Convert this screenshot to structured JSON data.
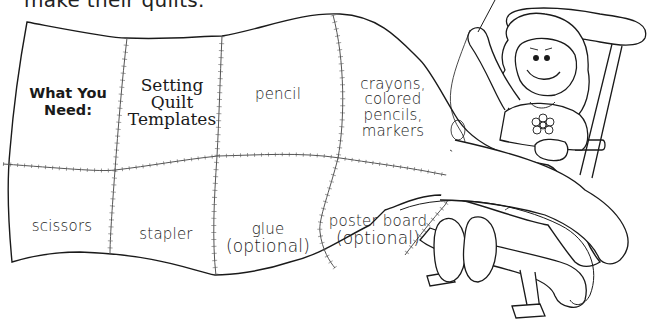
{
  "intro_text": "make their quilts.",
  "quilt": {
    "heading_line1": "What You",
    "heading_line2": "Need:",
    "top_row": [
      {
        "lines": [
          "Setting",
          "Quilt",
          "Templates"
        ]
      },
      {
        "lines": [
          "pencil"
        ]
      },
      {
        "lines": [
          "crayons,",
          "colored",
          "pencils,",
          "markers"
        ]
      }
    ],
    "bottom_row": [
      {
        "lines": [
          "scissors"
        ]
      },
      {
        "lines": [
          "stapler"
        ]
      },
      {
        "lines": [
          "glue",
          "(optional)"
        ]
      },
      {
        "lines": [
          "poster board",
          "(optional)"
        ]
      }
    ]
  },
  "illustration": {
    "subject": "girl-sewing-quilt-in-rocking-chair-icon",
    "colors": {
      "line": "#1a1a1a",
      "stitch": "#555555",
      "background": "#ffffff"
    }
  }
}
